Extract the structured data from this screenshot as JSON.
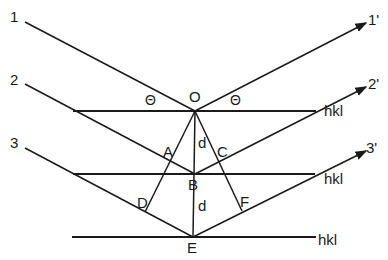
{
  "diagram": {
    "type": "bragg-diffraction",
    "incident_rays": [
      "1",
      "2",
      "3"
    ],
    "reflected_rays": [
      "1'",
      "2'",
      "3'"
    ],
    "points": {
      "O": "O",
      "A": "A",
      "B": "B",
      "C": "C",
      "D": "D",
      "E": "E",
      "F": "F"
    },
    "angle_label": "Θ",
    "spacing_label": "d",
    "plane_label": "hkl",
    "planes": [
      "hkl",
      "hkl",
      "hkl"
    ],
    "colors": {
      "line": "#1a1a1a",
      "background": "#ffffff"
    }
  }
}
